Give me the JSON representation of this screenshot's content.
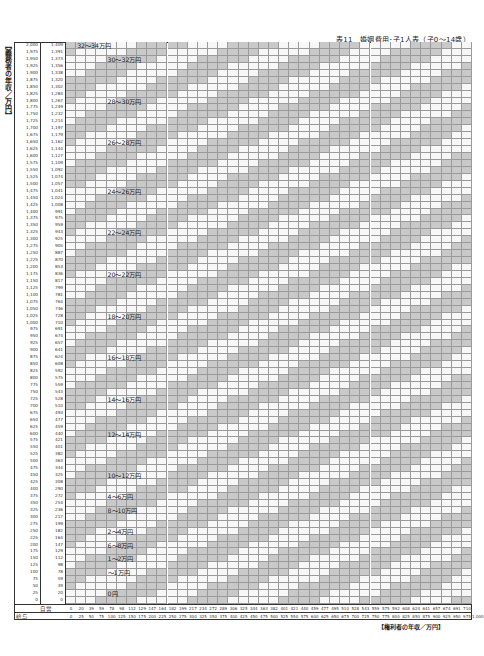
{
  "title": "表11　婚姻費用･子1人表（子0～14歳）",
  "y_axis_label": "【義務者の年収／万円】",
  "x_axis_label": "【権利者の年収／万円】",
  "x_row_captions": {
    "self_employed": "自営",
    "salary": "給与"
  },
  "colors": {
    "gray": "#c9c9c9",
    "white": "#f7f7f7",
    "line": "#9a9a9a"
  },
  "chart_data": {
    "type": "table",
    "title": "表11　婚姻費用･子1人表（子0～14歳）",
    "xlabel": "【権利者の年収／万円】",
    "ylabel": "【義務者の年収／万円】",
    "y_salary": [
      "2,000",
      "1,975",
      "1,950",
      "1,925",
      "1,900",
      "1,875",
      "1,850",
      "1,825",
      "1,800",
      "1,775",
      "1,750",
      "1,725",
      "1,700",
      "1,675",
      "1,650",
      "1,625",
      "1,600",
      "1,575",
      "1,550",
      "1,525",
      "1,500",
      "1,475",
      "1,450",
      "1,425",
      "1,400",
      "1,375",
      "1,350",
      "1,325",
      "1,300",
      "1,275",
      "1,250",
      "1,225",
      "1,200",
      "1,175",
      "1,150",
      "1,125",
      "1,100",
      "1,075",
      "1,050",
      "1,025",
      "1,000",
      "975",
      "950",
      "925",
      "900",
      "875",
      "850",
      "825",
      "800",
      "775",
      "750",
      "725",
      "700",
      "675",
      "650",
      "625",
      "600",
      "575",
      "550",
      "525",
      "500",
      "475",
      "450",
      "425",
      "400",
      "375",
      "350",
      "325",
      "300",
      "275",
      "250",
      "225",
      "200",
      "175",
      "150",
      "125",
      "100",
      "75",
      "50",
      "25",
      "0"
    ],
    "y_self_employed": [
      "1,409",
      "1,391",
      "1,373",
      "1,356",
      "1,338",
      "1,320",
      "1,302",
      "1,284",
      "1,267",
      "1,249",
      "1,232",
      "1,214",
      "1,197",
      "1,179",
      "1,162",
      "1,144",
      "1,127",
      "1,109",
      "1,092",
      "1,074",
      "1,057",
      "1,041",
      "1,024",
      "1,008",
      "991",
      "975",
      "959",
      "943",
      "925",
      "905",
      "887",
      "870",
      "853",
      "836",
      "817",
      "799",
      "781",
      "764",
      "746",
      "728",
      "710",
      "691",
      "674",
      "657",
      "641",
      "624",
      "608",
      "592",
      "575",
      "559",
      "543",
      "528",
      "510",
      "493",
      "477",
      "459",
      "440",
      "421",
      "401",
      "382",
      "363",
      "344",
      "325",
      "308",
      "290",
      "272",
      "254",
      "236",
      "217",
      "199",
      "182",
      "164",
      "147",
      "129",
      "112",
      "98",
      "78",
      "59",
      "39",
      "20",
      "0"
    ],
    "x_self_employed": [
      "0",
      "20",
      "39",
      "59",
      "78",
      "98",
      "112",
      "129",
      "147",
      "164",
      "182",
      "199",
      "217",
      "234",
      "272",
      "289",
      "306",
      "325",
      "344",
      "363",
      "382",
      "401",
      "421",
      "440",
      "459",
      "477",
      "495",
      "510",
      "528",
      "543",
      "559",
      "575",
      "592",
      "608",
      "624",
      "641",
      "657",
      "674",
      "691",
      "710"
    ],
    "x_salary": [
      "0",
      "25",
      "50",
      "75",
      "100",
      "125",
      "150",
      "175",
      "200",
      "225",
      "250",
      "275",
      "300",
      "325",
      "350",
      "375",
      "400",
      "425",
      "450",
      "475",
      "500",
      "525",
      "550",
      "575",
      "600",
      "625",
      "650",
      "675",
      "700",
      "725",
      "750",
      "775",
      "800",
      "825",
      "850",
      "875",
      "900",
      "925",
      "950",
      "975",
      "1,000"
    ],
    "bands": [
      {
        "label": "32～34万円",
        "row": 0,
        "col": 1
      },
      {
        "label": "30～32万円",
        "row": 2,
        "col": 4
      },
      {
        "label": "28～30万円",
        "row": 8,
        "col": 4
      },
      {
        "label": "26～28万円",
        "row": 14,
        "col": 4
      },
      {
        "label": "24～26万円",
        "row": 21,
        "col": 4
      },
      {
        "label": "22～24万円",
        "row": 27,
        "col": 4
      },
      {
        "label": "20～22万円",
        "row": 33,
        "col": 4
      },
      {
        "label": "18～20万円",
        "row": 39,
        "col": 4
      },
      {
        "label": "16～18万円",
        "row": 45,
        "col": 4
      },
      {
        "label": "14～16万円",
        "row": 51,
        "col": 4
      },
      {
        "label": "12～14万円",
        "row": 56,
        "col": 4
      },
      {
        "label": "10～12万円",
        "row": 62,
        "col": 4
      },
      {
        "label": "8～10万円",
        "row": 67,
        "col": 4
      },
      {
        "label": "6～8万円",
        "row": 72,
        "col": 4
      },
      {
        "label": "4～6万円",
        "row": 65,
        "col": 4
      },
      {
        "label": "2～4万円",
        "row": 70,
        "col": 4
      },
      {
        "label": "1～2万円",
        "row": 74,
        "col": 4
      },
      {
        "label": "～1万円",
        "row": 76,
        "col": 4
      },
      {
        "label": "0円",
        "row": 79,
        "col": 4
      }
    ]
  }
}
